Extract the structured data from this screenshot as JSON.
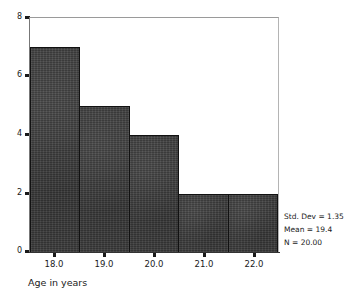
{
  "chart_data": {
    "type": "bar",
    "title": "",
    "subtitle": "",
    "xlabel": "Age in years",
    "ylabel": "",
    "categories": [
      "18.0",
      "19.0",
      "20.0",
      "21.0",
      "22.0"
    ],
    "values": [
      7,
      5,
      4,
      2,
      2
    ],
    "x_tick_labels": [
      "18.0",
      "19.0",
      "20.0",
      "21.0",
      "22.0"
    ],
    "y_tick_labels": [
      "0",
      "2",
      "4",
      "6",
      "8"
    ],
    "y_tick_values": [
      0,
      2,
      4,
      6,
      8
    ],
    "ylim": [
      0,
      8
    ],
    "xlim": [
      17.5,
      22.5
    ],
    "bin_width": 1,
    "grid": false,
    "legend": "none",
    "bar_color": "#3b3b3b",
    "bar_edge_color": "#111111",
    "background_color": "#ffffff",
    "annotations": [
      "Std. Dev = 1.35",
      "Mean = 19.4",
      "N = 20.00"
    ]
  },
  "stats": {
    "std_dev": "Std. Dev = 1.35",
    "mean": "Mean = 19.4",
    "n": "N = 20.00"
  },
  "axis": {
    "x_title": "Age in years"
  }
}
